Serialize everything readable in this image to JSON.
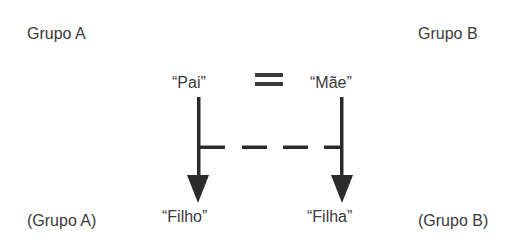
{
  "labels": {
    "group_a_top": "Grupo A",
    "group_b_top": "Grupo B",
    "father": "“Pai”",
    "mother": "“Mãe”",
    "son": "“Filho”",
    "daughter": "“Filha”",
    "group_a_bottom": "(Grupo A)",
    "group_b_bottom": "(Grupo B)"
  },
  "symbols": {
    "equals": "equals-sign",
    "arrows": [
      "arrow-down",
      "arrow-down"
    ],
    "link": "dashed-line"
  },
  "colors": {
    "text": "#3a3a3a",
    "lines": "#2b2b2b"
  }
}
